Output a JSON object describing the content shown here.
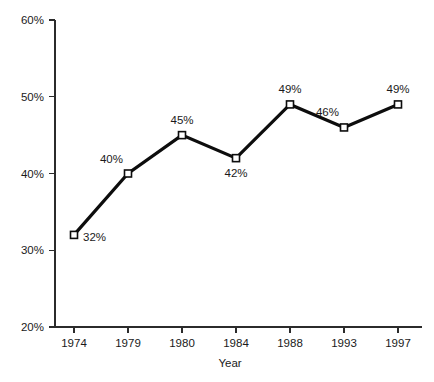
{
  "chart_data": {
    "type": "line",
    "title": "",
    "subtitle": "",
    "xlabel": "Year",
    "ylabel": "",
    "categories": [
      "1974",
      "1979",
      "1980",
      "1984",
      "1988",
      "1993",
      "1997"
    ],
    "values": [
      32,
      40,
      45,
      42,
      49,
      46,
      49
    ],
    "point_labels": [
      "32%",
      "40%",
      "45%",
      "42%",
      "49%",
      "46%",
      "49%"
    ],
    "label_positions": [
      "right",
      "above-left",
      "above",
      "below",
      "above",
      "above-left",
      "above"
    ],
    "ylim": [
      20,
      60
    ],
    "ytick_values": [
      20,
      30,
      40,
      50,
      60
    ],
    "ytick_labels": [
      "20%",
      "30%",
      "40%",
      "50%",
      "60%"
    ],
    "xtick_labels": [
      "1974",
      "1979",
      "1980",
      "1984",
      "1988",
      "1993",
      "1997"
    ],
    "grid": false,
    "legend": "none",
    "series": [
      {
        "name": "",
        "values": [
          32,
          40,
          45,
          42,
          49,
          46,
          49
        ],
        "color": "#0d0d0d",
        "marker": "open-square"
      }
    ],
    "colors": {
      "line": "#0d0d0d",
      "marker_fill": "#ffffff",
      "marker_stroke": "#0d0d0d",
      "axis": "#2b2b2b",
      "text": "#1a1a1a",
      "background": "#ffffff"
    }
  }
}
